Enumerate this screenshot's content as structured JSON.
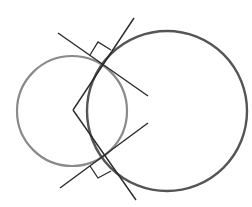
{
  "diagram": {
    "colors": {
      "background": "#ffffff",
      "small_circle": "#8a8a8a",
      "large_circle": "#555555",
      "lines": "#2a2a2a"
    },
    "circles": [
      {
        "name": "small-circle",
        "cx": 72,
        "cy": 111,
        "r": 55,
        "stroke": "#8a8a8a",
        "width": 2.2
      },
      {
        "name": "large-circle",
        "cx": 167,
        "cy": 111,
        "r": 80,
        "stroke": "#555555",
        "width": 2.4
      }
    ],
    "lines": [
      {
        "name": "upper-tangent-line",
        "x1": 58,
        "y1": 33,
        "x2": 148,
        "y2": 96
      },
      {
        "name": "upper-radius-line",
        "x1": 73,
        "y1": 110,
        "x2": 134,
        "y2": 18
      },
      {
        "name": "lower-tangent-line",
        "x1": 60,
        "y1": 188,
        "x2": 148,
        "y2": 123
      },
      {
        "name": "lower-radius-line",
        "x1": 73,
        "y1": 110,
        "x2": 136,
        "y2": 200
      }
    ],
    "right_angle_marks": [
      {
        "name": "upper-right-angle-mark",
        "points": "90,55 98,42 111,50"
      },
      {
        "name": "lower-right-angle-mark",
        "points": "90,166 98,178 111,171"
      }
    ],
    "intersection_points": [
      {
        "name": "upper-intersection",
        "x": 104,
        "y": 65
      },
      {
        "name": "lower-intersection",
        "x": 104,
        "y": 156
      }
    ]
  }
}
